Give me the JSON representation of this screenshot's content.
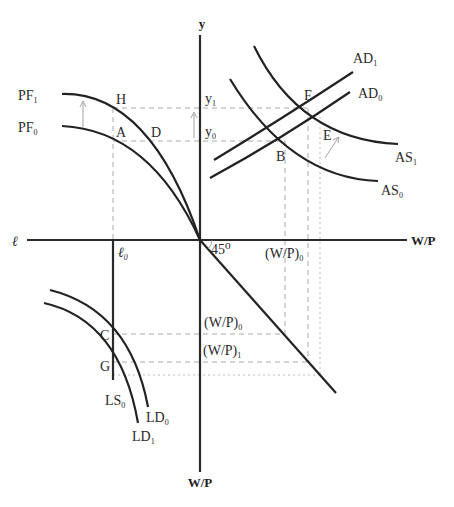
{
  "axes": {
    "y_top": "y",
    "x_right": "W/P",
    "x_left": "ℓ",
    "y_bottom": "W/P"
  },
  "angle_label": "45⁰",
  "levels": {
    "y1": {
      "base": "y",
      "sub": "1"
    },
    "y0": {
      "base": "y",
      "sub": "0"
    },
    "l0": {
      "base": "ℓ",
      "sub": "0"
    },
    "wp0_top": {
      "base": "(W/P)",
      "sub": "0"
    },
    "wp0_bottom": {
      "base": "(W/P)",
      "sub": "0"
    },
    "wp1_bottom": {
      "base": "(W/P)",
      "sub": "1"
    }
  },
  "curves": {
    "pf1": {
      "base": "PF",
      "sub": "1"
    },
    "pf0": {
      "base": "PF",
      "sub": "0"
    },
    "ad1": {
      "base": "AD",
      "sub": "1"
    },
    "ad0": {
      "base": "AD",
      "sub": "0"
    },
    "as1": {
      "base": "AS",
      "sub": "1"
    },
    "as0": {
      "base": "AS",
      "sub": "0"
    },
    "ls0": {
      "base": "LS",
      "sub": "0"
    },
    "ld0": {
      "base": "LD",
      "sub": "0"
    },
    "ld1": {
      "base": "LD",
      "sub": "1"
    }
  },
  "points": {
    "H": "H",
    "A": "A",
    "D": "D",
    "F": "F",
    "E": "E",
    "B": "B",
    "C": "C",
    "G": "G"
  }
}
